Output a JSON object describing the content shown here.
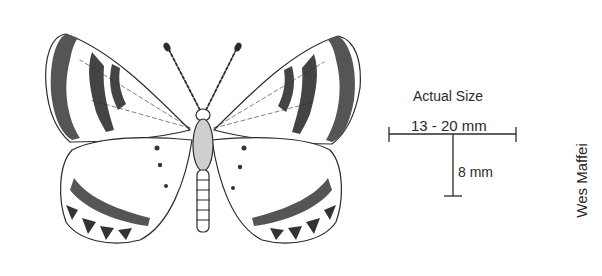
{
  "illustration": {
    "subject": "butterfly line drawing (dorsal view)",
    "ink_color": "#2b2b2b",
    "background": "#ffffff"
  },
  "scale": {
    "title": "Actual Size",
    "wingspan_label": "13 - 20 mm",
    "body_length_label": "8 mm"
  },
  "credit": {
    "artist": "Wes Maffei"
  }
}
